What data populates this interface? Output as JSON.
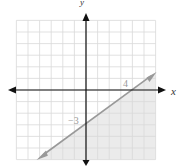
{
  "chart_data": {
    "type": "line",
    "title": "",
    "xlabel": "x",
    "ylabel": "y",
    "xlim": [
      -6,
      6
    ],
    "ylim": [
      -6,
      6
    ],
    "grid": true,
    "grid_step": 1,
    "series": [
      {
        "name": "boundary line",
        "equation": "y = (3/4)x - 3",
        "style": "solid",
        "points": [
          [
            -3.7,
            -5.775
          ],
          [
            0,
            -3
          ],
          [
            4,
            0
          ],
          [
            5.8,
            1.35
          ]
        ]
      }
    ],
    "shaded_region": "below the line (y ≤ (3/4)x − 3)",
    "annotations": [
      {
        "text": "4",
        "x": 4,
        "y": 0,
        "meaning": "x-intercept"
      },
      {
        "text": "−3",
        "x": 0,
        "y": -3,
        "meaning": "y-intercept"
      }
    ]
  },
  "labels": {
    "x_axis": "x",
    "y_axis": "y",
    "x_intercept": "4",
    "y_intercept": "−3"
  },
  "colors": {
    "grid": "#d9d9d9",
    "axis": "#111111",
    "line": "#999999",
    "shade": "#ebebeb"
  }
}
